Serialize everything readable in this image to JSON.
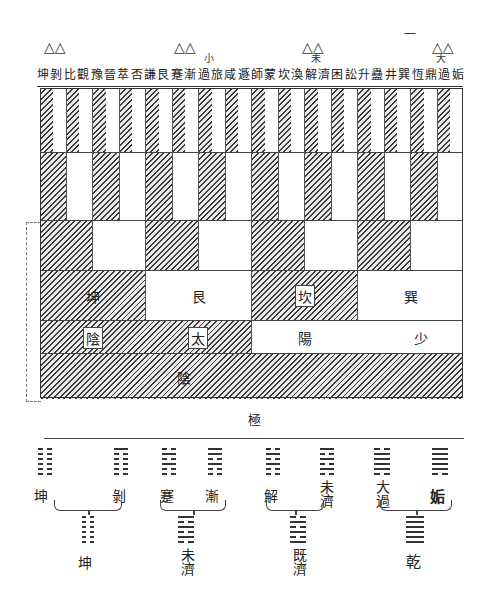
{
  "diagram": {
    "type": "hexagram-generation-chart",
    "top_mark": "一",
    "triangle_groups": [
      {
        "x": 46,
        "marks": "△△"
      },
      {
        "x": 176,
        "marks": "△△"
      },
      {
        "x": 304,
        "marks": "△△"
      },
      {
        "x": 434,
        "marks": "△△"
      }
    ],
    "annotations": [
      {
        "text": "小",
        "x": 205,
        "y": 54
      },
      {
        "text": "未",
        "x": 312,
        "y": 54
      },
      {
        "text": "大",
        "x": 437,
        "y": 54
      }
    ],
    "header_labels": [
      "坤",
      "剝",
      "比",
      "觀",
      "豫",
      "晉",
      "萃",
      "否",
      "謙",
      "艮",
      "蹇",
      "漸",
      "過",
      "旅",
      "咸",
      "遯",
      "師",
      "蒙",
      "坎",
      "渙",
      "解",
      "濟",
      "困",
      "訟",
      "升",
      "蠱",
      "井",
      "巽",
      "恆",
      "鼎",
      "過",
      "姤"
    ],
    "rows": [
      {
        "level": 1,
        "cells": 16,
        "pattern": "alternate-hatched-first"
      },
      {
        "level": 2,
        "cells": 16,
        "pattern": "alternate-hatched-first"
      },
      {
        "level": 3,
        "cells": 8,
        "pattern": "alternate-hatched-first"
      },
      {
        "level": 4,
        "cells": [
          {
            "label": "坤",
            "fill": "hatched",
            "boxed": false
          },
          {
            "label": "艮",
            "fill": "white",
            "boxed": false
          },
          {
            "label": "坎",
            "fill": "hatched",
            "boxed": true
          },
          {
            "label": "巽",
            "fill": "white",
            "boxed": false
          }
        ]
      },
      {
        "level": 5,
        "cells": [
          {
            "labels": [
              "陰",
              "太"
            ],
            "fill": "hatched",
            "boxed": true
          },
          {
            "labels": [
              "陽",
              "少"
            ],
            "fill": "white",
            "boxed": false
          }
        ]
      },
      {
        "level": 6,
        "cells": [
          {
            "label": "陰",
            "fill": "hatched"
          }
        ]
      }
    ],
    "ji_label": "極",
    "bottom_pairs": [
      {
        "left": "坤",
        "right": "剝",
        "result": "坤"
      },
      {
        "left": "蹇",
        "right": "漸",
        "result": "未濟"
      },
      {
        "left": "解",
        "right": "未濟",
        "result": "既濟"
      },
      {
        "left": "大過",
        "right": "姤",
        "result": "乾"
      }
    ]
  }
}
